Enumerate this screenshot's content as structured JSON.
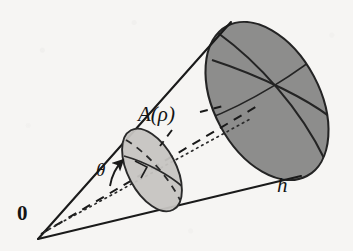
{
  "figure": {
    "kind": "geometry-diagram",
    "canvas": {
      "width": 353,
      "height": 251
    },
    "background_color": "#f6f5f3",
    "ink_color": "#1a1a1a",
    "labels": {
      "origin": "0",
      "angle": "θ",
      "area": "A(ρ)",
      "height": "h"
    },
    "parts": {
      "apex": {
        "name": "cone-apex",
        "x": 38,
        "y": 239
      },
      "upper_edge": {
        "name": "cone-upper-generator",
        "x1": 38,
        "y1": 239,
        "x2": 231,
        "y2": 22
      },
      "lower_edge": {
        "name": "cone-lower-generator",
        "x1": 38,
        "y1": 239,
        "x2": 301,
        "y2": 176
      },
      "axis_dashed": {
        "name": "cone-axis-dashed",
        "x1": 40,
        "y1": 233,
        "x2": 258,
        "y2": 106
      },
      "axis_dotted": {
        "name": "cone-axis-dotted",
        "x1": 42,
        "y1": 231,
        "x2": 250,
        "y2": 116
      },
      "small_cap": {
        "name": "small-spherical-cap",
        "cx": 152,
        "cy": 170,
        "rx": 24,
        "ry": 45,
        "rotation_deg": -28,
        "fill": "#c6c4c1",
        "stroke": "#2a2a2a"
      },
      "large_cap": {
        "name": "large-spherical-cap",
        "cx": 267,
        "cy": 101,
        "rx": 53,
        "ry": 85,
        "rotation_deg": -28,
        "fill": "#8d8d8c",
        "stroke": "#242424"
      },
      "theta_arrow": {
        "name": "theta-angle-arrow",
        "from_x": 108,
        "from_y": 184,
        "to_x": 123,
        "to_y": 160
      },
      "right_angle_marker": {
        "name": "right-angle-marker",
        "x": 143,
        "y": 168
      }
    }
  }
}
